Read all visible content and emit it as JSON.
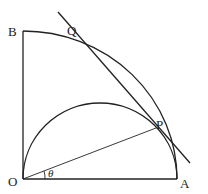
{
  "diagram": {
    "title": "",
    "points": {
      "O": {
        "label": "O",
        "x": 23,
        "y": 179
      },
      "A": {
        "label": "A",
        "x": 177,
        "y": 179
      },
      "B": {
        "label": "B",
        "x": 23,
        "y": 31
      },
      "P": {
        "label": "P",
        "x": 154,
        "y": 128
      },
      "Q": {
        "label": "Q",
        "x": 67,
        "y": 38
      }
    },
    "angle_label": "θ",
    "elements": [
      "segment OA",
      "segment OB",
      "quarter circle arc from A to B centered at O",
      "semicircle on diameter OA",
      "segment OP",
      "tangent line through Q and P"
    ]
  }
}
